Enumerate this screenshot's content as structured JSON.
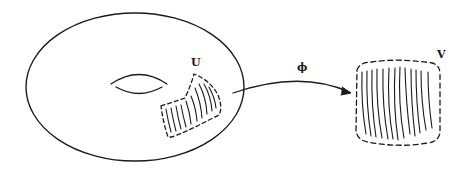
{
  "diagram": {
    "labels": {
      "patch_on_torus": "U",
      "map": "ϕ",
      "target_region": "V"
    },
    "colors": {
      "stroke": "#1a1a1a",
      "background": "#ffffff"
    },
    "elements": [
      {
        "id": "torus",
        "type": "ellipse",
        "note": "closed surface with central hole"
      },
      {
        "id": "hole",
        "type": "lens",
        "note": "torus hole"
      },
      {
        "id": "patch-u",
        "type": "dashed region",
        "note": "hatched with curved lines"
      },
      {
        "id": "arrow-phi",
        "type": "curved arrow",
        "from": "U",
        "to": "V"
      },
      {
        "id": "region-v",
        "type": "dashed rounded box",
        "note": "hatched with near-vertical lines"
      }
    ]
  }
}
